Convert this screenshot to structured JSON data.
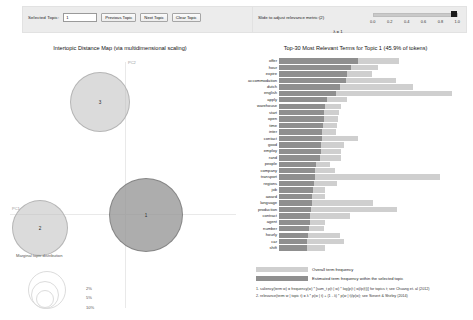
{
  "controls": {
    "selected_topic_label": "Selected Topic:",
    "selected_topic_value": "1",
    "previous_topic": "Previous Topic",
    "next_topic": "Next Topic",
    "clear_topic": "Clear Topic"
  },
  "relevance": {
    "label": "Slide to adjust relevance metric:(2)",
    "lambda_text": "λ = 1",
    "ticks": [
      "0.0",
      "0.2",
      "0.4",
      "0.6",
      "0.8",
      "1.0"
    ],
    "value": 1.0
  },
  "left_panel": {
    "title": "Intertopic Distance Map (via multidimensional scaling)",
    "axis_x": "PC1",
    "axis_y": "PC2",
    "marginal_caption": "Marginal topic distribution",
    "size_legend": [
      "2%",
      "5%",
      "10%"
    ],
    "topics": [
      {
        "id": "3",
        "x": 64,
        "y": 16,
        "size": 58,
        "selected": false
      },
      {
        "id": "2",
        "x": 6,
        "y": 144,
        "size": 54,
        "selected": false
      },
      {
        "id": "1",
        "x": 103,
        "y": 122,
        "size": 72,
        "selected": true
      }
    ]
  },
  "right_panel": {
    "title": "Top-30 Most Relevant Terms for Topic 1 (45.9% of tokens)",
    "legend": {
      "overall": "Overall term frequency",
      "topic": "Estimated term frequency within the selected topic"
    },
    "footnotes": [
      "1. saliency(term w) = frequency(w) * [sum_t p(t | w) * log(p(t | w)/p(t))] for topics t; see Chuang et. al (2012)",
      "2. relevance(term w | topic t) = λ * p(w | t) + (1 - λ) * p(w | t)/p(w); see Sievert & Shirley (2014)"
    ],
    "colors": {
      "overall": "#cfcfcf",
      "topic": "#8f8f8f"
    }
  },
  "chart_data": {
    "type": "bar",
    "title": "Top-30 Most Relevant Terms for Topic 1 (45.9% of tokens)",
    "orientation": "horizontal",
    "xlabel": "",
    "ylabel": "",
    "categories": [
      "offer",
      "hour",
      "expire",
      "accommodation",
      "dutch",
      "english",
      "apply",
      "warehouse",
      "start",
      "open",
      "time",
      "inter",
      "contact",
      "good",
      "employ",
      "rand",
      "people",
      "company",
      "transport",
      "regions",
      "job",
      "award",
      "language",
      "production",
      "contract",
      "agent",
      "number",
      "hourly",
      "car",
      "shift"
    ],
    "series": [
      {
        "name": "Overall term frequency",
        "values": [
          161,
          133,
          125,
          157,
          180,
          232,
          92,
          83,
          80,
          79,
          78,
          77,
          106,
          88,
          84,
          83,
          69,
          75,
          216,
          78,
          62,
          62,
          127,
          158,
          95,
          62,
          60,
          82,
          88,
          62
        ]
      },
      {
        "name": "Estimated term frequency within the selected topic",
        "values": [
          106,
          97,
          92,
          90,
          82,
          77,
          64,
          62,
          61,
          60,
          59,
          58,
          58,
          57,
          56,
          55,
          50,
          49,
          48,
          47,
          46,
          45,
          44,
          43,
          42,
          41,
          40,
          39,
          38,
          37
        ]
      }
    ],
    "xlim": [
      0,
      250
    ],
    "grid": false,
    "legend_position": "bottom"
  }
}
